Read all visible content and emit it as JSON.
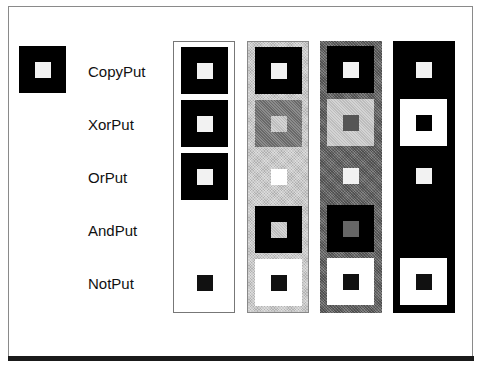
{
  "diagram": {
    "source_icon": {
      "outer": "#000000",
      "inner": "#f2f2f2"
    },
    "modes": [
      {
        "label": "CopyPut"
      },
      {
        "label": "XorPut"
      },
      {
        "label": "OrPut"
      },
      {
        "label": "AndPut"
      },
      {
        "label": "NotPut"
      }
    ],
    "columns": [
      {
        "background": "white"
      },
      {
        "background": "light-gray"
      },
      {
        "background": "dark-gray"
      },
      {
        "background": "black"
      }
    ],
    "colors": {
      "black": "#000000",
      "white": "#ffffff",
      "light_gray": "#c9c9c9",
      "dark_gray": "#6e6e6e",
      "frame": "#8a8a8a"
    }
  }
}
